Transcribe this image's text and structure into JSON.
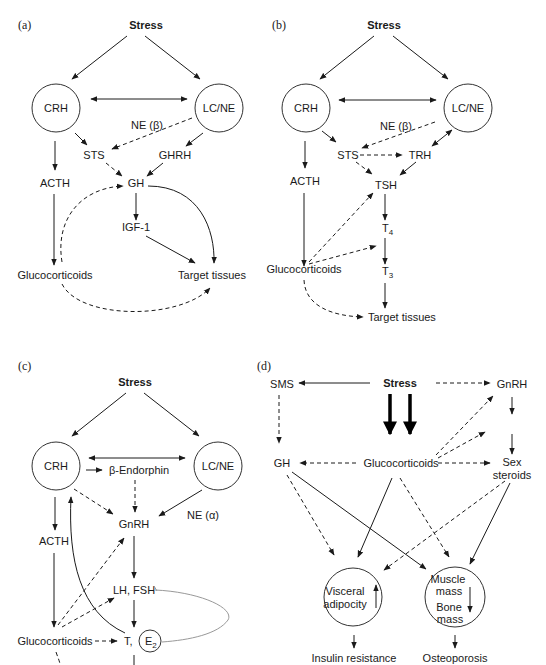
{
  "figure": {
    "panels": [
      {
        "id": "a",
        "label": "(a)",
        "nodes": {
          "stress": "Stress",
          "crh": "CRH",
          "lcne": "LC/NE",
          "ne_beta": "NE (β)",
          "sts": "STS",
          "ghrh": "GHRH",
          "acth": "ACTH",
          "gh": "GH",
          "igf1": "IGF-1",
          "glucocorticoids": "Glucocorticoids",
          "target_tissues": "Target tissues"
        }
      },
      {
        "id": "b",
        "label": "(b)",
        "nodes": {
          "stress": "Stress",
          "crh": "CRH",
          "lcne": "LC/NE",
          "ne_beta": "NE (β)",
          "sts": "STS",
          "trh": "TRH",
          "acth": "ACTH",
          "tsh": "TSH",
          "t4": "T",
          "t4_sub": "4",
          "t3": "T",
          "t3_sub": "3",
          "glucocorticoids": "Glucocorticoids",
          "target_tissues": "Target tissues"
        }
      },
      {
        "id": "c",
        "label": "(c)",
        "nodes": {
          "stress": "Stress",
          "crh": "CRH",
          "lcne": "LC/NE",
          "beta_endorphin": "β-Endorphin",
          "gnrh": "GnRH",
          "ne_alpha": "NE (α)",
          "acth": "ACTH",
          "lh_fsh": "LH, FSH",
          "glucocorticoids": "Glucocorticoids",
          "t": "T,",
          "e2": "E",
          "e2_sub": "2"
        }
      },
      {
        "id": "d",
        "label": "(d)",
        "nodes": {
          "sms": "SMS",
          "stress": "Stress",
          "gnrh": "GnRH",
          "gh": "GH",
          "glucocorticoids": "Glucocorticoids",
          "sex_steroids_1": "Sex",
          "sex_steroids_2": "steroids",
          "visceral_1": "Visceral",
          "visceral_2": "adipocity",
          "muscle_1": "Muscle",
          "muscle_2": "mass",
          "bone_1": "Bone",
          "bone_2": "mass",
          "insulin_resistance": "Insulin resistance",
          "osteoporosis": "Osteoporosis"
        }
      }
    ]
  }
}
